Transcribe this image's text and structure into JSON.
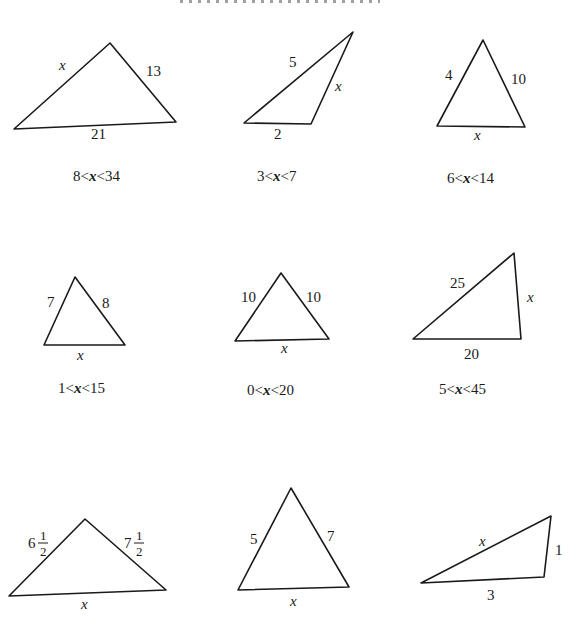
{
  "problems": [
    {
      "id": 1,
      "sides": {
        "left": "x",
        "right": "13",
        "base": "21"
      },
      "answer": "8<x<34",
      "answer_parts": [
        "8<",
        "x",
        "<34"
      ]
    },
    {
      "id": 2,
      "sides": {
        "top": "5",
        "right": "x",
        "base": "2"
      },
      "answer": "3<x<7",
      "answer_parts": [
        "3<",
        "x",
        "<7"
      ]
    },
    {
      "id": 3,
      "sides": {
        "left": "4",
        "right": "10",
        "base": "x"
      },
      "answer": "6<x<14",
      "answer_parts": [
        "6<",
        "x",
        "<14"
      ]
    },
    {
      "id": 4,
      "sides": {
        "left": "7",
        "right": "8",
        "base": "x"
      },
      "answer": "1<x<15",
      "answer_parts": [
        "1<",
        "x",
        "<15"
      ]
    },
    {
      "id": 5,
      "sides": {
        "left": "10",
        "right": "10",
        "base": "x"
      },
      "answer": "0<x<20",
      "answer_parts": [
        "0<",
        "x",
        "<20"
      ]
    },
    {
      "id": 6,
      "sides": {
        "top": "25",
        "right": "x",
        "base": "20"
      },
      "answer": "5<x<45",
      "answer_parts": [
        "5<",
        "x",
        "<45"
      ]
    },
    {
      "id": 7,
      "sides": {
        "left_whole": "6",
        "left_num": "1",
        "left_den": "2",
        "right_whole": "7",
        "right_num": "1",
        "right_den": "2",
        "base": "x"
      }
    },
    {
      "id": 8,
      "sides": {
        "left": "5",
        "right": "7",
        "base": "x"
      }
    },
    {
      "id": 9,
      "sides": {
        "top": "x",
        "right": "1",
        "base": "3"
      }
    }
  ]
}
